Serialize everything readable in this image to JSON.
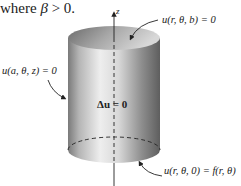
{
  "intro_text": {
    "prefix": "where ",
    "symbol": "β",
    "suffix": " > 0."
  },
  "diagram": {
    "axis_label": "z",
    "interior_equation": "Δu = 0",
    "boundary_labels": {
      "top": "u(r, θ, b) = 0",
      "side": "u(a, θ, z) = 0",
      "bottom": "u(r, θ, 0) = f(r, θ)"
    },
    "colors": {
      "cylinder_dark": "#6e6e6e",
      "cylinder_light": "#f2f2f2",
      "axis": "#222222"
    }
  }
}
